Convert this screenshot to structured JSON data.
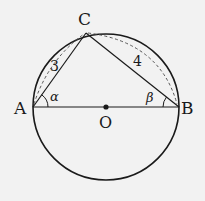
{
  "diagram": {
    "type": "geometry",
    "colors": {
      "background": "#f2f2f2",
      "stroke": "#1a1a1a"
    },
    "circle": {
      "center_label": "O",
      "cx": 106,
      "cy": 107,
      "r": 73
    },
    "points": {
      "A": {
        "label": "A",
        "x": 33,
        "y": 107
      },
      "B": {
        "label": "B",
        "x": 179,
        "y": 107
      },
      "C": {
        "label": "C",
        "x": 86,
        "y": 33
      },
      "O": {
        "label": "O",
        "x": 106,
        "y": 107
      }
    },
    "segments": [
      {
        "from": "A",
        "to": "B",
        "style": "solid",
        "role": "diameter"
      },
      {
        "from": "A",
        "to": "C",
        "style": "solid",
        "length_label": "3"
      },
      {
        "from": "C",
        "to": "B",
        "style": "solid",
        "length_label": "4"
      }
    ],
    "dashed_arcs": [
      {
        "from": "A",
        "to": "C"
      },
      {
        "from": "C",
        "to": "B"
      }
    ],
    "angles": {
      "alpha": {
        "label": "α",
        "vertex": "A"
      },
      "beta": {
        "label": "β",
        "vertex": "B"
      }
    },
    "length_labels": {
      "AC": "3",
      "CB": "4"
    }
  }
}
